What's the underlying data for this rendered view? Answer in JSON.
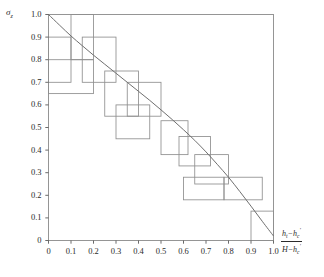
{
  "figure": {
    "axis_labels": {
      "y": "σ",
      "y_sub": "z",
      "x_numer_1": "h",
      "x_numer_1_sub": "t",
      "x_minus": "−",
      "x_numer_2": "h",
      "x_numer_2_sub": "c",
      "x_numer_2_sup": "′",
      "x_denom_1": "H",
      "x_denom_minus": "−",
      "x_denom_2": "h",
      "x_denom_2_sub": "c",
      "x_denom_2_sup": "′"
    }
  },
  "chart_data": {
    "type": "line",
    "title": "",
    "xlabel": "(h_t − h_c′)/(H − h_c′)",
    "ylabel": "σ_z",
    "xlim": [
      0,
      1.0
    ],
    "ylim": [
      0,
      1.0
    ],
    "grid": false,
    "legend": "none",
    "xticks": [
      "0",
      "0.1",
      "0.2",
      "0.3",
      "0.4",
      "0.5",
      "0.6",
      "0.7",
      "0.8",
      "0.9",
      "1.0"
    ],
    "xtick_values": [
      0,
      0.1,
      0.2,
      0.3,
      0.4,
      0.5,
      0.6,
      0.7,
      0.8,
      0.9,
      1.0
    ],
    "yticks": [
      "0",
      "0.1",
      "0.2",
      "0.3",
      "0.4",
      "0.5",
      "0.6",
      "0.7",
      "0.8",
      "0.9",
      "1.0"
    ],
    "ytick_values": [
      0,
      0.1,
      0.2,
      0.3,
      0.4,
      0.5,
      0.6,
      0.7,
      0.8,
      0.9,
      1.0
    ],
    "series": [
      {
        "name": "design curve",
        "color": "#6f6f6f",
        "x": [
          0.0,
          0.05,
          0.1,
          0.15,
          0.2,
          0.25,
          0.3,
          0.35,
          0.4,
          0.45,
          0.5,
          0.55,
          0.6,
          0.65,
          0.7,
          0.75,
          0.8,
          0.85,
          0.9,
          0.95,
          1.0
        ],
        "y": [
          1.0,
          0.952,
          0.905,
          0.862,
          0.82,
          0.78,
          0.74,
          0.7,
          0.66,
          0.62,
          0.578,
          0.535,
          0.49,
          0.443,
          0.392,
          0.337,
          0.28,
          0.217,
          0.152,
          0.085,
          0.02
        ]
      }
    ],
    "boxes": [
      {
        "x0": 0.1,
        "x1": 0.2,
        "y0": 0.8,
        "y1": 1.0
      },
      {
        "x0": 0.0,
        "x1": 0.1,
        "y0": 0.7,
        "y1": 0.9
      },
      {
        "x0": 0.15,
        "x1": 0.3,
        "y0": 0.7,
        "y1": 0.9
      },
      {
        "x0": 0.0,
        "x1": 0.2,
        "y0": 0.65,
        "y1": 0.8
      },
      {
        "x0": 0.25,
        "x1": 0.4,
        "y0": 0.55,
        "y1": 0.75
      },
      {
        "x0": 0.35,
        "x1": 0.5,
        "y0": 0.55,
        "y1": 0.7
      },
      {
        "x0": 0.3,
        "x1": 0.45,
        "y0": 0.45,
        "y1": 0.6
      },
      {
        "x0": 0.5,
        "x1": 0.62,
        "y0": 0.38,
        "y1": 0.53
      },
      {
        "x0": 0.58,
        "x1": 0.72,
        "y0": 0.33,
        "y1": 0.46
      },
      {
        "x0": 0.65,
        "x1": 0.8,
        "y0": 0.25,
        "y1": 0.38
      },
      {
        "x0": 0.6,
        "x1": 0.78,
        "y0": 0.18,
        "y1": 0.28
      },
      {
        "x0": 0.78,
        "x1": 0.95,
        "y0": 0.18,
        "y1": 0.28
      },
      {
        "x0": 0.9,
        "x1": 1.0,
        "y0": 0.0,
        "y1": 0.13
      }
    ]
  }
}
